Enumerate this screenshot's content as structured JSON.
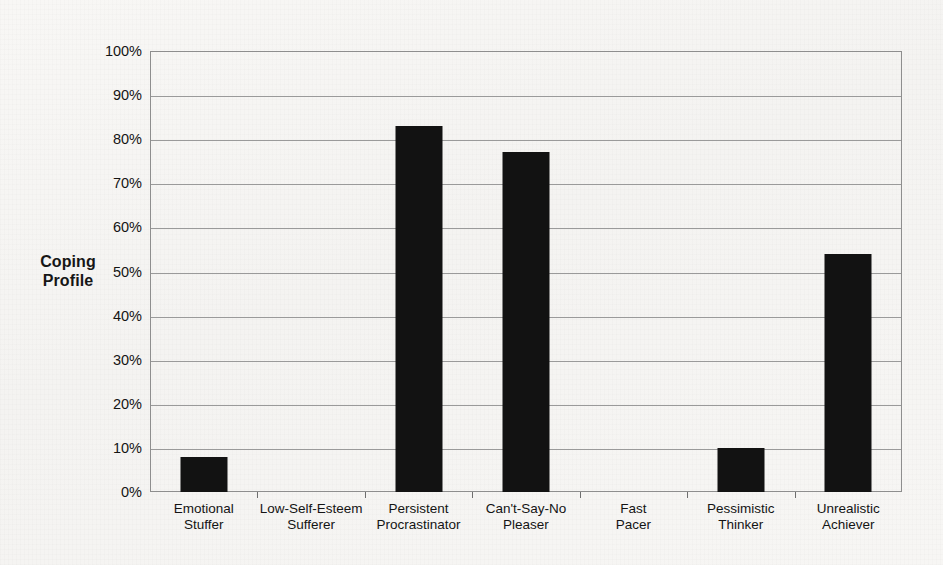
{
  "chart_data": {
    "type": "bar",
    "title": "",
    "subtitle": "",
    "xlabel": "",
    "ylabel": "Coping Profile",
    "ylabel_lines": [
      "Coping",
      "Profile"
    ],
    "categories": [
      "Emotional Stuffer",
      "Low-Self-Esteem Sufferer",
      "Persistent Procrastinator",
      "Can't-Say-No Pleaser",
      "Fast Pacer",
      "Pessimistic Thinker",
      "Unrealistic Achiever"
    ],
    "category_lines": [
      [
        "Emotional",
        "Stuffer"
      ],
      [
        "Low-Self-Esteem",
        "Sufferer"
      ],
      [
        "Persistent",
        "Procrastinator"
      ],
      [
        "Can't-Say-No",
        "Pleaser"
      ],
      [
        "Fast",
        "Pacer"
      ],
      [
        "Pessimistic",
        "Thinker"
      ],
      [
        "Unrealistic",
        "Achiever"
      ]
    ],
    "values": [
      8,
      0,
      83,
      77,
      0,
      10,
      54
    ],
    "value_labels": [
      "8%",
      "0%",
      "83%",
      "77%",
      "0%",
      "10%",
      "54%"
    ],
    "ylim": [
      0,
      100
    ],
    "ytick_values": [
      0,
      10,
      20,
      30,
      40,
      50,
      60,
      70,
      80,
      90,
      100
    ],
    "ytick_labels": [
      "0%",
      "10%",
      "20%",
      "30%",
      "40%",
      "50%",
      "60%",
      "70%",
      "80%",
      "90%",
      "100%"
    ],
    "grid": true,
    "grid_axis": "y",
    "legend": false,
    "legend_position": "none",
    "bar_color": "#121212",
    "grid_color": "#9a9a9a",
    "axis_color": "#8e8e8e",
    "background_color": "#f6f5f3",
    "text_color": "#141414"
  }
}
